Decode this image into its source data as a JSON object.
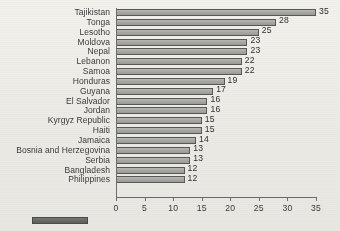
{
  "chart_data": {
    "type": "bar",
    "orientation": "horizontal",
    "title": "",
    "xlabel": "",
    "ylabel": "",
    "xlim": [
      0,
      35
    ],
    "xticks": [
      0,
      5,
      10,
      15,
      20,
      25,
      30,
      35
    ],
    "grid": false,
    "legend": "none",
    "bar_color": "#a9a9a4",
    "bar_border_color": "#58585a",
    "categories": [
      "Tajikistan",
      "Tonga",
      "Lesotho",
      "Moldova",
      "Nepal",
      "Lebanon",
      "Samoa",
      "Honduras",
      "Guyana",
      "El Salvador",
      "Jordan",
      "Kyrgyz Republic",
      "Haiti",
      "Jamaica",
      "Bosnia and Herzegovina",
      "Serbia",
      "Bangladesh",
      "Philippines"
    ],
    "values": [
      35,
      28,
      25,
      23,
      23,
      22,
      22,
      19,
      17,
      16,
      16,
      15,
      15,
      14,
      13,
      13,
      12,
      12
    ],
    "value_labels": [
      "35",
      "28",
      "25",
      "23",
      "23",
      "22",
      "22",
      "19",
      "17",
      "16",
      "16",
      "15",
      "15",
      "14",
      "13",
      "13",
      "12",
      "12"
    ],
    "xtick_labels": [
      "0",
      "5",
      "10",
      "15",
      "20",
      "25",
      "30",
      "35"
    ]
  },
  "legend": {
    "swatch_color": "#6a6a67",
    "label": ""
  }
}
